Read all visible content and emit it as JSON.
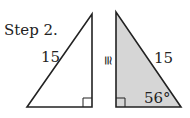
{
  "step_label": "Step 2.",
  "congruence_symbol": "≅",
  "left_triangle": {
    "hypotenuse_label": "15",
    "right_angle_marker": true,
    "fill": "#ffffff"
  },
  "right_triangle": {
    "hypotenuse_label": "15",
    "angle_label": "56°",
    "right_angle_marker": true,
    "fill": "#d6d6d6"
  },
  "colors": {
    "stroke": "#222222",
    "shaded_fill": "#d6d6d6"
  }
}
